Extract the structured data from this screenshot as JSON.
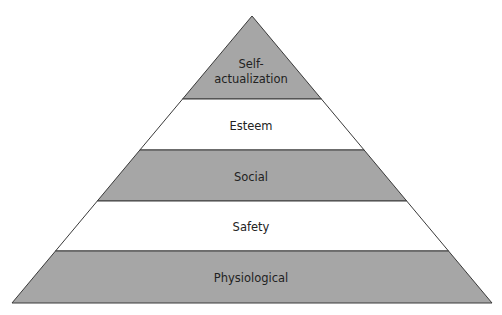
{
  "diagram": {
    "type": "pyramid",
    "colors": {
      "gray_fill": "#a6a6a6",
      "white_fill": "#ffffff",
      "stroke": "#3a3a3a",
      "text": "#222222"
    },
    "levels": [
      {
        "line1": "Self-",
        "line2": "actualization",
        "fill": "gray"
      },
      {
        "label": "Esteem",
        "fill": "white"
      },
      {
        "label": "Social",
        "fill": "gray"
      },
      {
        "label": "Safety",
        "fill": "white"
      },
      {
        "label": "Physiological",
        "fill": "gray"
      }
    ]
  }
}
